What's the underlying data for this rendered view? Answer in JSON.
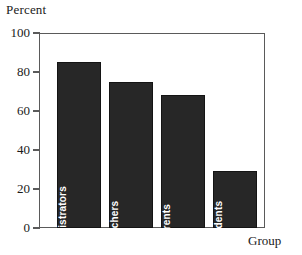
{
  "chart_data": {
    "type": "bar",
    "title": "",
    "subtitle": "",
    "xlabel": "Group",
    "ylabel": "Percent",
    "categories": [
      "Administrators",
      "Teachers",
      "Parents",
      "Students"
    ],
    "values": [
      85,
      75,
      68,
      29
    ],
    "series": [
      {
        "name": "Percent",
        "values": [
          85,
          75,
          68,
          29
        ]
      }
    ],
    "ylim": [
      0,
      100
    ],
    "yticks": [
      0,
      20,
      40,
      60,
      80,
      100
    ],
    "ytick_labels": [
      "0",
      "20",
      "40",
      "60",
      "80",
      "100"
    ],
    "xticks": [],
    "xtick_labels": [],
    "grid": false,
    "legend": false,
    "legend_position": "none",
    "annotations": [
      {
        "text": "Administrators",
        "placement": "inside-bar-rotated"
      },
      {
        "text": "Teachers",
        "placement": "inside-bar-rotated"
      },
      {
        "text": "Parents",
        "placement": "inside-bar-rotated"
      },
      {
        "text": "Students",
        "placement": "inside-bar-rotated"
      }
    ],
    "colors": {
      "bar_fill": "#272727",
      "bar_edge": "#141414",
      "bar_label_text": "#ffffff",
      "axis": "#5a5a5a",
      "text": "#1a1a1a",
      "background": "#ffffff"
    }
  }
}
